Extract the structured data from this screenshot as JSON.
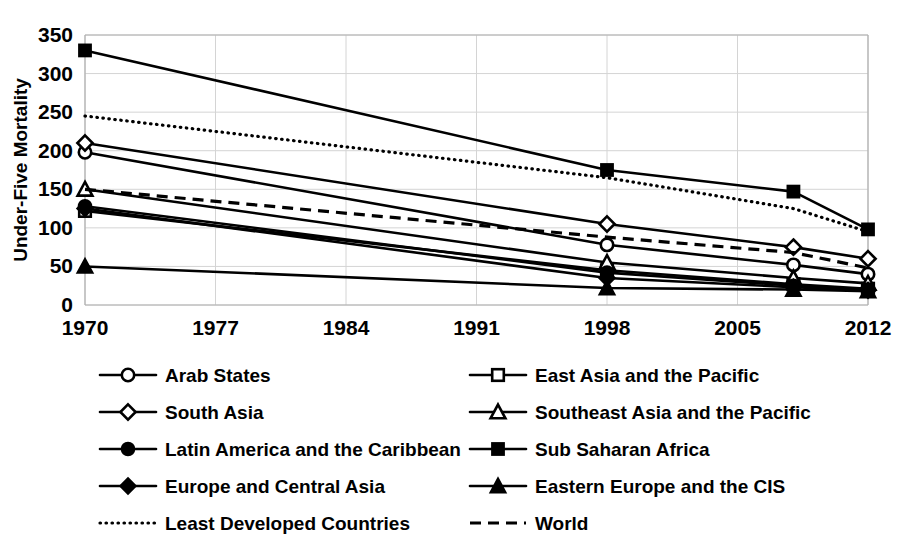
{
  "chart_data": {
    "type": "line",
    "title": "",
    "xlabel": "",
    "ylabel": "Under-Five Mortality",
    "xlim": [
      1970,
      2012
    ],
    "ylim": [
      0,
      350
    ],
    "ytick_step": 50,
    "grid": true,
    "legend_position": "bottom",
    "legend_columns": 2,
    "x_tick_labels": [
      "1970",
      "1977",
      "1984",
      "1991",
      "1998",
      "2005",
      "2012"
    ],
    "x_ticks": [
      1970,
      1977,
      1984,
      1991,
      1998,
      2005,
      2012
    ],
    "y_tick_labels": [
      "0",
      "50",
      "100",
      "150",
      "200",
      "250",
      "300",
      "350"
    ],
    "y_ticks": [
      0,
      50,
      100,
      150,
      200,
      250,
      300,
      350
    ],
    "x": [
      1970,
      1998,
      2008,
      2012
    ],
    "series": [
      {
        "name": "Arab States",
        "marker": "circle-open",
        "line_style": "solid",
        "values": [
          198,
          78,
          52,
          40
        ]
      },
      {
        "name": "East Asia and the Pacific",
        "marker": "square-open",
        "line_style": "solid",
        "values": [
          122,
          45,
          27,
          21
        ]
      },
      {
        "name": "South Asia",
        "marker": "diamond-open",
        "line_style": "solid",
        "values": [
          210,
          105,
          75,
          60
        ]
      },
      {
        "name": "Southeast Asia and the Pacific",
        "marker": "triangle-open",
        "line_style": "solid",
        "values": [
          150,
          55,
          35,
          28
        ]
      },
      {
        "name": "Latin America and the Caribbean",
        "marker": "circle-filled",
        "line_style": "solid",
        "values": [
          128,
          42,
          25,
          20
        ]
      },
      {
        "name": "Sub Saharan Africa",
        "marker": "square-filled",
        "line_style": "solid",
        "values": [
          330,
          175,
          147,
          98
        ]
      },
      {
        "name": "Europe and Central Asia",
        "marker": "diamond-filled",
        "line_style": "solid",
        "values": [
          125,
          35,
          23,
          19
        ]
      },
      {
        "name": "Eastern Europe and the CIS",
        "marker": "triangle-filled",
        "line_style": "solid",
        "values": [
          50,
          22,
          20,
          18
        ]
      },
      {
        "name": "Least Developed Countries",
        "marker": "none",
        "line_style": "dotted",
        "values": [
          245,
          165,
          125,
          95
        ]
      },
      {
        "name": "World",
        "marker": "none",
        "line_style": "dashed",
        "values": [
          150,
          88,
          68,
          48
        ]
      }
    ],
    "series_color": "#000000"
  },
  "legend": {
    "items": [
      {
        "label": "Arab States",
        "marker": "circle-open",
        "line_style": "solid"
      },
      {
        "label": "East Asia and the Pacific",
        "marker": "square-open",
        "line_style": "solid"
      },
      {
        "label": "South Asia",
        "marker": "diamond-open",
        "line_style": "solid"
      },
      {
        "label": "Southeast Asia and the Pacific",
        "marker": "triangle-open",
        "line_style": "solid"
      },
      {
        "label": "Latin America and the Caribbean",
        "marker": "circle-filled",
        "line_style": "solid"
      },
      {
        "label": "Sub Saharan Africa",
        "marker": "square-filled",
        "line_style": "solid"
      },
      {
        "label": "Europe and Central Asia",
        "marker": "diamond-filled",
        "line_style": "solid"
      },
      {
        "label": "Eastern Europe and the CIS",
        "marker": "triangle-filled",
        "line_style": "solid"
      },
      {
        "label": "Least Developed Countries",
        "marker": "none",
        "line_style": "dotted"
      },
      {
        "label": "World",
        "marker": "none",
        "line_style": "dashed"
      }
    ]
  }
}
